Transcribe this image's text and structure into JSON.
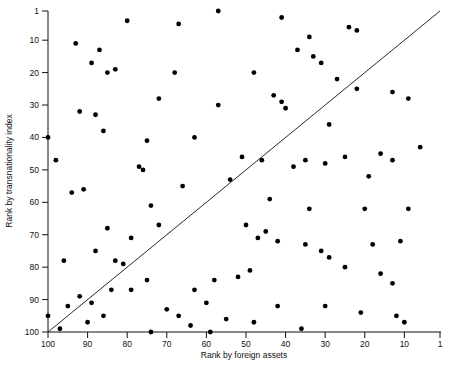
{
  "chart_data": {
    "type": "scatter",
    "title": "",
    "subtitle": "",
    "xlabel": "Rank by foreign assets",
    "ylabel": "Rank by transnationality index",
    "xlim": [
      100,
      1
    ],
    "ylim": [
      100,
      1
    ],
    "x_axis_reversed": true,
    "y_axis_reversed": true,
    "grid": false,
    "legend": null,
    "xticks": [
      100,
      90,
      80,
      70,
      60,
      50,
      40,
      30,
      20,
      10,
      1
    ],
    "yticks": [
      1,
      10,
      20,
      30,
      40,
      50,
      60,
      70,
      80,
      90,
      100
    ],
    "annotations": [
      {
        "name": "diagonal-reference-line",
        "description": "45-degree identity line from (100,100) to (1,1)",
        "from": [
          100,
          100
        ],
        "to": [
          1,
          1
        ]
      }
    ],
    "series": [
      {
        "name": "Transnational corporations",
        "marker": "filled-circle",
        "color": "#000000",
        "points": [
          [
            80,
            4
          ],
          [
            93,
            11
          ],
          [
            87,
            13
          ],
          [
            67,
            5
          ],
          [
            57,
            1
          ],
          [
            41,
            3
          ],
          [
            34,
            9
          ],
          [
            24,
            6
          ],
          [
            22,
            7
          ],
          [
            33,
            15
          ],
          [
            31,
            17
          ],
          [
            85,
            20
          ],
          [
            83,
            19
          ],
          [
            89,
            17
          ],
          [
            68,
            20
          ],
          [
            48,
            20
          ],
          [
            37,
            13
          ],
          [
            27,
            22
          ],
          [
            22,
            25
          ],
          [
            13,
            26
          ],
          [
            9,
            28
          ],
          [
            88,
            33
          ],
          [
            92,
            32
          ],
          [
            72,
            28
          ],
          [
            57,
            30
          ],
          [
            40,
            31
          ],
          [
            29,
            36
          ],
          [
            86,
            38
          ],
          [
            75,
            41
          ],
          [
            63,
            40
          ],
          [
            51,
            46
          ],
          [
            46,
            47
          ],
          [
            43,
            27
          ],
          [
            41,
            29
          ],
          [
            35,
            47
          ],
          [
            25,
            46
          ],
          [
            19,
            52
          ],
          [
            6,
            43
          ],
          [
            77,
            49
          ],
          [
            76,
            50
          ],
          [
            38,
            49
          ],
          [
            30,
            48
          ],
          [
            16,
            45
          ],
          [
            13,
            47
          ],
          [
            100,
            40
          ],
          [
            98,
            47
          ],
          [
            94,
            57
          ],
          [
            91,
            56
          ],
          [
            74,
            61
          ],
          [
            66,
            55
          ],
          [
            54,
            53
          ],
          [
            44,
            59
          ],
          [
            34,
            62
          ],
          [
            20,
            62
          ],
          [
            9,
            62
          ],
          [
            79,
            71
          ],
          [
            85,
            68
          ],
          [
            72,
            67
          ],
          [
            50,
            67
          ],
          [
            47,
            71
          ],
          [
            45,
            69
          ],
          [
            42,
            72
          ],
          [
            35,
            73
          ],
          [
            31,
            75
          ],
          [
            29,
            77
          ],
          [
            18,
            73
          ],
          [
            11,
            72
          ],
          [
            96,
            78
          ],
          [
            88,
            75
          ],
          [
            83,
            78
          ],
          [
            81,
            79
          ],
          [
            75,
            84
          ],
          [
            63,
            87
          ],
          [
            58,
            84
          ],
          [
            52,
            83
          ],
          [
            49,
            81
          ],
          [
            25,
            80
          ],
          [
            16,
            82
          ],
          [
            13,
            85
          ],
          [
            89,
            91
          ],
          [
            92,
            89
          ],
          [
            84,
            87
          ],
          [
            79,
            87
          ],
          [
            70,
            93
          ],
          [
            67,
            95
          ],
          [
            60,
            91
          ],
          [
            42,
            92
          ],
          [
            30,
            92
          ],
          [
            21,
            94
          ],
          [
            12,
            95
          ],
          [
            10,
            97
          ],
          [
            100,
            95
          ],
          [
            90,
            97
          ],
          [
            74,
            100
          ],
          [
            59,
            100
          ],
          [
            36,
            99
          ],
          [
            55,
            96
          ],
          [
            48,
            97
          ],
          [
            64,
            98
          ],
          [
            97,
            99
          ],
          [
            95,
            92
          ],
          [
            86,
            95
          ]
        ]
      }
    ]
  },
  "axes": {
    "x_title": "Rank by foreign assets",
    "y_title": "Rank by transnationality index"
  }
}
